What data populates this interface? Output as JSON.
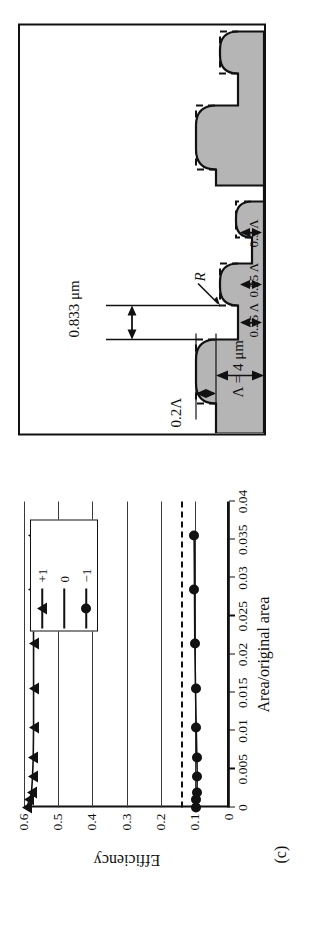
{
  "figure": {
    "panel_letter": "(c)"
  },
  "chart_data": {
    "type": "line",
    "title": "",
    "xlabel": "Area/original area",
    "ylabel": "Efficiency",
    "xlim": [
      0,
      0.04
    ],
    "ylim": [
      0,
      0.6
    ],
    "xticks": [
      "0",
      "0.005",
      "0.01",
      "0.015",
      "0.02",
      "0.025",
      "0.03",
      "0.035",
      "0.04"
    ],
    "xtick_values": [
      0,
      0.005,
      0.01,
      0.015,
      0.02,
      0.025,
      0.03,
      0.035,
      0.04
    ],
    "yticks": [
      "0",
      "0.1",
      "0.2",
      "0.3",
      "0.4",
      "0.5",
      "0.6"
    ],
    "ytick_values": [
      0,
      0.1,
      0.2,
      0.3,
      0.4,
      0.5,
      0.6
    ],
    "grid": "horizontal",
    "legend_position": "top-right-inside",
    "series": [
      {
        "name": "+1",
        "marker": "triangle",
        "x": [
          0.0,
          0.001,
          0.002,
          0.004,
          0.0065,
          0.0105,
          0.0155,
          0.0215,
          0.0285,
          0.0355
        ],
        "values": [
          0.592,
          0.584,
          0.578,
          0.575,
          0.573,
          0.572,
          0.572,
          0.572,
          0.573,
          0.575
        ]
      },
      {
        "name": "0",
        "marker": "none",
        "x": [],
        "values": []
      },
      {
        "name": "-1",
        "marker": "circle",
        "x": [
          0.0,
          0.001,
          0.002,
          0.004,
          0.0065,
          0.0105,
          0.0155,
          0.0215,
          0.0285,
          0.0355
        ],
        "values": [
          0.098,
          0.096,
          0.094,
          0.093,
          0.094,
          0.096,
          0.098,
          0.1,
          0.101,
          0.102
        ]
      }
    ],
    "reference_line": {
      "style": "dashed",
      "orientation": "horizontal",
      "value": 0.14
    },
    "legend": [
      {
        "label": "+1",
        "marker": "triangle"
      },
      {
        "label": "0",
        "marker": "none"
      },
      {
        "label": "−1",
        "marker": "circle"
      }
    ]
  },
  "schematic": {
    "labels": {
      "period": "Λ = 4 μm",
      "depth": "0.2Λ",
      "step_width": "0.833 μm",
      "radius": "R",
      "seg_a": "0.3 Λ",
      "seg_b": "0.25 Λ",
      "seg_c": "0.25 Λ"
    },
    "colors": {
      "fill": "#b3b3b3",
      "outline": "#111111",
      "ideal_profile": "#111111"
    }
  }
}
